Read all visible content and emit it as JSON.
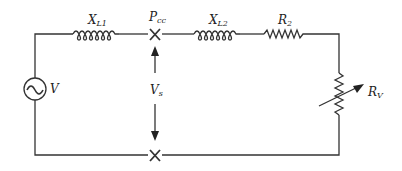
{
  "diagram": {
    "type": "circuit",
    "labels": {
      "xl1": {
        "main": "X",
        "sub": "L1"
      },
      "xl2": {
        "main": "X",
        "sub": "L2"
      },
      "pcc": {
        "main": "P",
        "sub": "cc"
      },
      "r2": {
        "main": "R",
        "sub": "2"
      },
      "rv": {
        "main": "R",
        "sub": "V"
      },
      "v": {
        "main": "V"
      },
      "vs": {
        "main": "V",
        "sub": "s"
      }
    },
    "components": [
      "AC voltage source V",
      "inductor X_L1",
      "point of common coupling P_cc",
      "inductor X_L2",
      "resistor R2",
      "variable resistor R_V"
    ]
  }
}
